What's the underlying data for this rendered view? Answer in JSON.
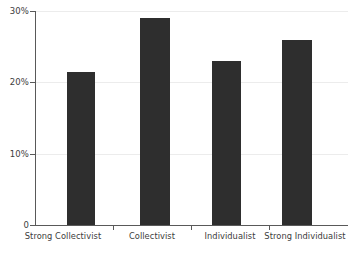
{
  "chart_data": {
    "type": "bar",
    "title": "",
    "subtitle": "",
    "xlabel": "",
    "ylabel": "",
    "categories": [
      "Strong Collectivist",
      "Collectivist",
      "Individualist",
      "Strong Individualist"
    ],
    "values": [
      21.5,
      29,
      23,
      26
    ],
    "ylim": [
      0,
      30
    ],
    "y_tick_values": [
      0,
      10,
      20,
      30
    ],
    "y_tick_labels": [
      "0",
      "10%",
      "20%",
      "30%"
    ],
    "grid": true,
    "legend": null,
    "legend_position": "none",
    "annotations": [],
    "bar_color": "#2e2e2e",
    "gridline_color": "#ececec",
    "axis_color": "#595959",
    "background_color": "#ffffff"
  }
}
